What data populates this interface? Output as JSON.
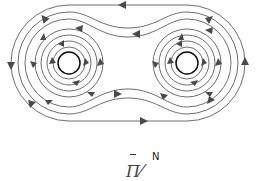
{
  "diagram": {
    "line_color": "#6e6e6e",
    "arrow_color": "#4a4a4a",
    "wire_color": "#111111",
    "wires": [
      {
        "name": "left-wire",
        "cx": 69,
        "cy": 63,
        "r": 11
      },
      {
        "name": "right-wire",
        "cx": 187,
        "cy": 63,
        "r": 11
      }
    ],
    "inner_loop_radii": [
      16,
      22,
      28,
      34
    ]
  },
  "caption": {
    "letter": "N",
    "glyph": "Π⁄"
  }
}
